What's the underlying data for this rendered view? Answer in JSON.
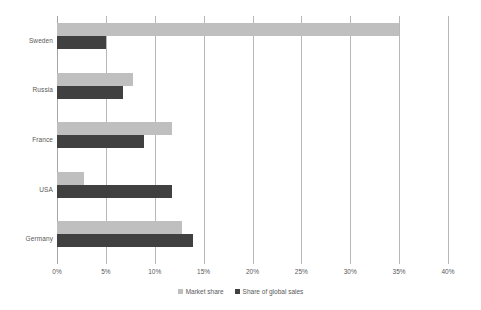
{
  "chart_data": {
    "type": "bar",
    "orientation": "horizontal",
    "title": "",
    "subtitle": "",
    "xlabel": "",
    "ylabel": "",
    "categories": [
      "Sweden",
      "Russia",
      "France",
      "USA",
      "Germany"
    ],
    "series": [
      {
        "name": "Market share",
        "color": "#bfbfbf",
        "values": [
          35.0,
          7.8,
          11.8,
          2.8,
          12.8
        ]
      },
      {
        "name": "Share of global sales",
        "color": "#404040",
        "values": [
          5.0,
          6.8,
          8.9,
          11.8,
          13.9
        ]
      }
    ],
    "xlim": [
      0,
      40
    ],
    "xticks": [
      0,
      5,
      10,
      15,
      20,
      25,
      30,
      35,
      40
    ],
    "xtick_labels": [
      "0%",
      "5%",
      "10%",
      "15%",
      "20%",
      "25%",
      "30%",
      "35%",
      "40%"
    ],
    "grid": true,
    "grid_axis": "x",
    "legend": [
      "Market share",
      "Share of global sales"
    ],
    "legend_position": "bottom",
    "background_color": "#ffffff",
    "gridline_color": "#b7b7b7",
    "axis_label_color": "#595959"
  },
  "legend": {
    "items": [
      {
        "label": "Market share",
        "swatch_name": "legend-swatch-market-share"
      },
      {
        "label": "Share of global sales",
        "swatch_name": "legend-swatch-share-of-global-sales"
      }
    ]
  }
}
